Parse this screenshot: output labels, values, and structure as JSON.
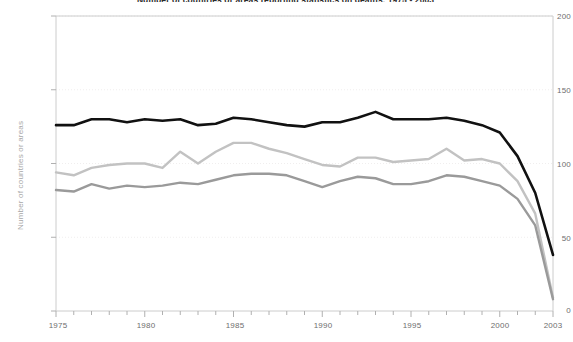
{
  "chart_data": {
    "type": "line",
    "title": "Number of countries or areas reporting statistics on deaths, 1975 - 2003",
    "xlabel": "",
    "ylabel": "Number of countries or areas",
    "xlim": [
      1975,
      2003
    ],
    "ylim": [
      0,
      200
    ],
    "yticks": [
      0,
      50,
      100,
      150,
      200
    ],
    "xticks": [
      1975,
      1980,
      1985,
      1990,
      1995,
      2000,
      2003
    ],
    "xtick_labels": [
      "1975",
      "1980",
      "1985",
      "1990",
      "1995",
      "2000",
      "2003"
    ],
    "ytick_labels": [
      "0",
      "50",
      "100",
      "150",
      "200"
    ],
    "grid": true,
    "grid_style": "dotted-horizontal-faint",
    "legend": "none",
    "x": [
      1975,
      1976,
      1977,
      1978,
      1979,
      1980,
      1981,
      1982,
      1983,
      1984,
      1985,
      1986,
      1987,
      1988,
      1989,
      1990,
      1991,
      1992,
      1993,
      1994,
      1995,
      1996,
      1997,
      1998,
      1999,
      2000,
      2001,
      2002,
      2003
    ],
    "series": [
      {
        "name": "series-black-upper",
        "color": "#111111",
        "values": [
          126,
          126,
          130,
          130,
          128,
          130,
          129,
          130,
          126,
          127,
          131,
          130,
          128,
          126,
          125,
          128,
          128,
          131,
          135,
          130,
          130,
          130,
          131,
          129,
          126,
          121,
          105,
          80,
          38
        ]
      },
      {
        "name": "series-light-gray-middle",
        "color": "#c2c2c2",
        "values": [
          94,
          92,
          97,
          99,
          100,
          100,
          97,
          108,
          100,
          108,
          114,
          114,
          110,
          107,
          103,
          99,
          98,
          104,
          104,
          101,
          102,
          103,
          110,
          102,
          103,
          100,
          88,
          66,
          9
        ]
      },
      {
        "name": "series-medium-gray-lower",
        "color": "#9a9a9a",
        "values": [
          82,
          81,
          86,
          83,
          85,
          84,
          85,
          87,
          86,
          89,
          92,
          93,
          93,
          92,
          88,
          84,
          88,
          91,
          90,
          86,
          86,
          88,
          92,
          91,
          88,
          85,
          76,
          58,
          8
        ]
      }
    ]
  },
  "axis": {
    "frame_color": "#cccccc",
    "tick_color": "#b0b0b0",
    "label_color": "#6e6e6e",
    "ylabel_color": "#a8a8a8"
  }
}
